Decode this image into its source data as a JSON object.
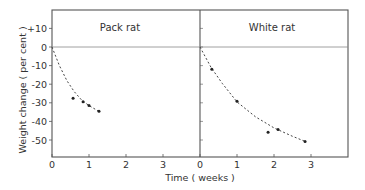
{
  "chart_data": {
    "type": "scatter",
    "title": "",
    "xlabel": "Time  ( weeks )",
    "ylabel": "Weight  change  ( per  cent )",
    "ylim": [
      -55,
      15
    ],
    "xlim": [
      0,
      4
    ],
    "yticks": [
      "+10",
      "0",
      "-10",
      "-20",
      "-30",
      "-40",
      "-50"
    ],
    "ytick_values": [
      10,
      0,
      -10,
      -20,
      -30,
      -40,
      -50
    ],
    "xticks": [
      "0",
      "1",
      "2",
      "3"
    ],
    "xtick_values": [
      0,
      1,
      2,
      3
    ],
    "grid": false,
    "reference_line_y": 0,
    "panels": [
      {
        "name": "Pack rat",
        "points": [
          {
            "x": 0.57,
            "y": -27.6
          },
          {
            "x": 0.84,
            "y": -29.5
          },
          {
            "x": 1.0,
            "y": -31.4
          },
          {
            "x": 1.27,
            "y": -34.6
          }
        ],
        "fit_curve": [
          {
            "x": 0.0,
            "y": 0
          },
          {
            "x": 0.2,
            "y": -10
          },
          {
            "x": 0.4,
            "y": -18
          },
          {
            "x": 0.6,
            "y": -24
          },
          {
            "x": 0.8,
            "y": -28.5
          },
          {
            "x": 1.0,
            "y": -31.5
          },
          {
            "x": 1.3,
            "y": -35
          }
        ]
      },
      {
        "name": "White rat",
        "points": [
          {
            "x": 0.32,
            "y": -11.9
          },
          {
            "x": 1.0,
            "y": -29.2
          },
          {
            "x": 1.84,
            "y": -45.9
          },
          {
            "x": 2.11,
            "y": -44.3
          },
          {
            "x": 2.84,
            "y": -50.8
          }
        ],
        "fit_curve": [
          {
            "x": 0.0,
            "y": 0
          },
          {
            "x": 0.3,
            "y": -11
          },
          {
            "x": 0.6,
            "y": -19.5
          },
          {
            "x": 1.0,
            "y": -29.5
          },
          {
            "x": 1.5,
            "y": -37.5
          },
          {
            "x": 2.0,
            "y": -43.5
          },
          {
            "x": 2.5,
            "y": -48
          },
          {
            "x": 2.85,
            "y": -50.8
          }
        ]
      }
    ]
  }
}
